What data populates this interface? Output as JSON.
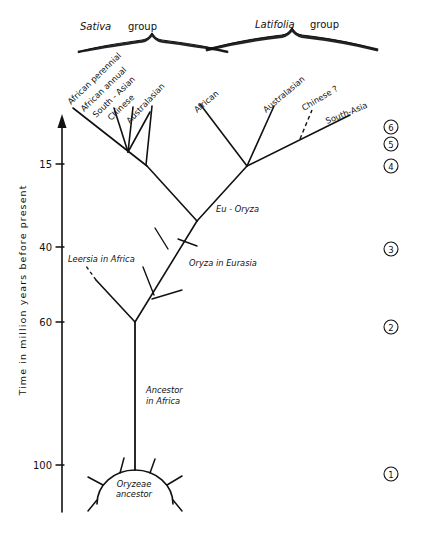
{
  "figure": {
    "type": "phylogenetic-tree",
    "axis": {
      "title": "Time in million years before present",
      "ticks": [
        "15",
        "40",
        "60",
        "100"
      ],
      "arrow_direction": "up"
    },
    "groups": [
      {
        "name_italic": "Sativa",
        "name_rest": "group"
      },
      {
        "name_italic": "Latifolia",
        "name_rest": "group"
      }
    ],
    "sativa_tips": [
      "African  perennial",
      "African  annual",
      "South - Asian",
      "Chinese",
      "Australasian"
    ],
    "latifolia_tips": [
      "African",
      "Australasian",
      "Chinese ?",
      "South-Asia"
    ],
    "node_labels": [
      "Eu - Oryza",
      "Oryza in Eurasia",
      "Leersia in Africa",
      "Ancestor",
      "in  Africa",
      "Oryzeae",
      "ancestor"
    ],
    "stage_markers": [
      "6",
      "5",
      "4",
      "3",
      "2",
      "1"
    ],
    "colors": {
      "ink": "#111111",
      "paper": "#ffffff"
    }
  }
}
